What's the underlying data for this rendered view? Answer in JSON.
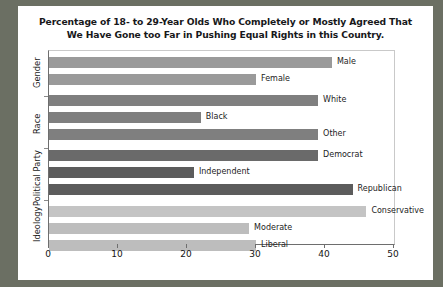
{
  "chart_data": {
    "type": "bar",
    "orientation": "horizontal",
    "title": "Percentage of 18- to 29-Year Olds Who Completely or Mostly Agreed That We Have Gone too Far in Pushing Equal Rights in this Country.",
    "title_line1": "Percentage of 18- to 29-Year Olds Who Completely or Mostly Agreed That",
    "title_line2": "We Have Gone too Far in Pushing Equal Rights in this Country.",
    "xlabel": "",
    "ylabel": "",
    "xlim": [
      0,
      50
    ],
    "xticks": [
      0,
      10,
      20,
      30,
      40,
      50
    ],
    "xtick_labels": [
      "0",
      "10",
      "20",
      "30",
      "40",
      "50"
    ],
    "grid": false,
    "legend": "none",
    "groups": [
      {
        "name": "Gender",
        "color": "#9a9a9a"
      },
      {
        "name": "Race",
        "color": "#7f7f7f"
      },
      {
        "name": "Political Party",
        "color": "#5f5f5f"
      },
      {
        "name": "Ideology",
        "color": "#c4c4c4"
      }
    ],
    "categories": [
      "Male",
      "Female",
      "White",
      "Black",
      "Other",
      "Democrat",
      "Independent",
      "Republican",
      "Conservative",
      "Moderate",
      "Liberal"
    ],
    "values": [
      41,
      30,
      39,
      22,
      39,
      39,
      21,
      44,
      46,
      29,
      30
    ],
    "bars": [
      {
        "label": "Male",
        "value": 41,
        "group": "Gender",
        "color": "#9a9a9a"
      },
      {
        "label": "Female",
        "value": 30,
        "group": "Gender",
        "color": "#9a9a9a"
      },
      {
        "label": "White",
        "value": 39,
        "group": "Race",
        "color": "#7f7f7f"
      },
      {
        "label": "Black",
        "value": 22,
        "group": "Race",
        "color": "#7f7f7f"
      },
      {
        "label": "Other",
        "value": 39,
        "group": "Race",
        "color": "#7f7f7f"
      },
      {
        "label": "Democrat",
        "value": 39,
        "group": "Political Party",
        "color": "#6a6a6a"
      },
      {
        "label": "Independent",
        "value": 21,
        "group": "Political Party",
        "color": "#5c5c5c"
      },
      {
        "label": "Republican",
        "value": 44,
        "group": "Political Party",
        "color": "#5c5c5c"
      },
      {
        "label": "Conservative",
        "value": 46,
        "group": "Ideology",
        "color": "#c4c4c4"
      },
      {
        "label": "Moderate",
        "value": 29,
        "group": "Ideology",
        "color": "#bdbdbd"
      },
      {
        "label": "Liberal",
        "value": 30,
        "group": "Ideology",
        "color": "#bdbdbd"
      }
    ],
    "group_labels": [
      "Gender",
      "Race",
      "Political Party",
      "Ideology"
    ],
    "colors": {
      "background": "#ffffff",
      "page_background": "#6b6f63",
      "axis": "#6e6e6e",
      "text": "#17181a"
    }
  }
}
